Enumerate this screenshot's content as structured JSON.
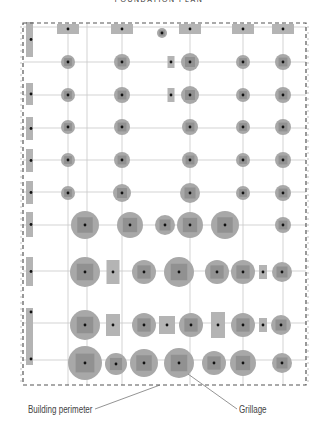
{
  "title": "FOUNDATION PLAN",
  "labels": {
    "perimeter": "Building perimeter",
    "grillage": "Grillage"
  },
  "colors": {
    "grid_line": "#c8c8c8",
    "perimeter": "#555555",
    "footing_fill": "#a8a8a8",
    "footing_core": "#7e7e7e",
    "strip_fill": "#b4b4b4",
    "pile": "#111111",
    "leader": "#666666"
  },
  "grid": {
    "columns_x": [
      31,
      68,
      122,
      180,
      242,
      284
    ],
    "rows_y": [
      27,
      62,
      95,
      128,
      160,
      192,
      225,
      271,
      323,
      360
    ]
  },
  "perimeter_box": {
    "x": 23,
    "y": 23,
    "w": 283,
    "h": 362
  },
  "left_strips": [
    {
      "y": 22,
      "h": 35
    },
    {
      "y": 83,
      "h": 22
    },
    {
      "y": 117,
      "h": 23
    },
    {
      "y": 149,
      "h": 23
    },
    {
      "y": 181,
      "h": 23
    },
    {
      "y": 212,
      "h": 25
    },
    {
      "y": 257,
      "h": 29
    },
    {
      "y": 308,
      "h": 57
    }
  ],
  "footings": [
    {
      "t": "rect",
      "x": 68,
      "y": 29,
      "w": 22,
      "h": 10
    },
    {
      "t": "rect",
      "x": 122,
      "y": 29,
      "w": 22,
      "h": 10
    },
    {
      "t": "circ",
      "x": 162,
      "y": 33,
      "r": 5
    },
    {
      "t": "rect",
      "x": 190,
      "y": 29,
      "w": 22,
      "h": 10
    },
    {
      "t": "rect",
      "x": 243,
      "y": 29,
      "w": 22,
      "h": 10
    },
    {
      "t": "rect",
      "x": 283,
      "y": 29,
      "w": 22,
      "h": 10
    },
    {
      "t": "circ",
      "x": 68,
      "y": 62,
      "r": 7
    },
    {
      "t": "circ",
      "x": 122,
      "y": 62,
      "r": 8
    },
    {
      "t": "rect",
      "x": 171,
      "y": 62,
      "w": 7,
      "h": 12
    },
    {
      "t": "circ",
      "x": 190,
      "y": 62,
      "r": 9
    },
    {
      "t": "circ",
      "x": 243,
      "y": 62,
      "r": 7
    },
    {
      "t": "circ",
      "x": 283,
      "y": 62,
      "r": 8
    },
    {
      "t": "circ",
      "x": 68,
      "y": 95,
      "r": 7
    },
    {
      "t": "circ",
      "x": 122,
      "y": 95,
      "r": 8
    },
    {
      "t": "rect",
      "x": 171,
      "y": 95,
      "w": 7,
      "h": 14
    },
    {
      "t": "circ",
      "x": 190,
      "y": 95,
      "r": 9
    },
    {
      "t": "circ",
      "x": 243,
      "y": 95,
      "r": 7
    },
    {
      "t": "circ",
      "x": 283,
      "y": 95,
      "r": 8
    },
    {
      "t": "circ",
      "x": 68,
      "y": 127,
      "r": 7
    },
    {
      "t": "circ",
      "x": 122,
      "y": 127,
      "r": 8
    },
    {
      "t": "circ",
      "x": 190,
      "y": 127,
      "r": 8
    },
    {
      "t": "circ",
      "x": 243,
      "y": 127,
      "r": 7
    },
    {
      "t": "circ",
      "x": 283,
      "y": 127,
      "r": 8
    },
    {
      "t": "circ",
      "x": 68,
      "y": 160,
      "r": 7
    },
    {
      "t": "circ",
      "x": 122,
      "y": 160,
      "r": 8
    },
    {
      "t": "circ",
      "x": 190,
      "y": 160,
      "r": 8
    },
    {
      "t": "circ",
      "x": 243,
      "y": 160,
      "r": 7
    },
    {
      "t": "circ",
      "x": 283,
      "y": 160,
      "r": 8
    },
    {
      "t": "circ",
      "x": 68,
      "y": 193,
      "r": 7
    },
    {
      "t": "circ",
      "x": 122,
      "y": 193,
      "r": 9
    },
    {
      "t": "circ",
      "x": 190,
      "y": 193,
      "r": 10
    },
    {
      "t": "circ",
      "x": 243,
      "y": 193,
      "r": 7
    },
    {
      "t": "circ",
      "x": 283,
      "y": 193,
      "r": 8
    },
    {
      "t": "circ",
      "x": 85,
      "y": 225,
      "r": 14
    },
    {
      "t": "circ",
      "x": 130,
      "y": 225,
      "r": 13
    },
    {
      "t": "circ",
      "x": 165,
      "y": 225,
      "r": 10
    },
    {
      "t": "circ",
      "x": 190,
      "y": 225,
      "r": 13
    },
    {
      "t": "circ",
      "x": 225,
      "y": 225,
      "r": 14
    },
    {
      "t": "circ",
      "x": 283,
      "y": 225,
      "r": 8
    },
    {
      "t": "circ",
      "x": 85,
      "y": 272,
      "r": 15
    },
    {
      "t": "rect",
      "x": 113,
      "y": 272,
      "w": 13,
      "h": 24
    },
    {
      "t": "circ",
      "x": 144,
      "y": 272,
      "r": 12
    },
    {
      "t": "circ",
      "x": 179,
      "y": 272,
      "r": 15
    },
    {
      "t": "circ",
      "x": 217,
      "y": 272,
      "r": 12
    },
    {
      "t": "circ",
      "x": 243,
      "y": 272,
      "r": 12
    },
    {
      "t": "rect",
      "x": 263,
      "y": 272,
      "w": 8,
      "h": 14
    },
    {
      "t": "circ",
      "x": 282,
      "y": 272,
      "r": 10
    },
    {
      "t": "circ",
      "x": 85,
      "y": 325,
      "r": 15
    },
    {
      "t": "rect",
      "x": 113,
      "y": 325,
      "w": 14,
      "h": 22
    },
    {
      "t": "circ",
      "x": 144,
      "y": 325,
      "r": 12
    },
    {
      "t": "rect",
      "x": 167,
      "y": 325,
      "w": 16,
      "h": 18
    },
    {
      "t": "circ",
      "x": 191,
      "y": 325,
      "r": 12
    },
    {
      "t": "rect",
      "x": 218,
      "y": 325,
      "w": 14,
      "h": 26
    },
    {
      "t": "circ",
      "x": 243,
      "y": 325,
      "r": 12
    },
    {
      "t": "rect",
      "x": 263,
      "y": 325,
      "w": 8,
      "h": 14
    },
    {
      "t": "circ",
      "x": 281,
      "y": 325,
      "r": 10
    },
    {
      "t": "circ",
      "x": 85,
      "y": 363,
      "r": 17
    },
    {
      "t": "circ",
      "x": 116,
      "y": 364,
      "r": 11
    },
    {
      "t": "circ",
      "x": 144,
      "y": 363,
      "r": 14
    },
    {
      "t": "circ",
      "x": 179,
      "y": 363,
      "r": 15
    },
    {
      "t": "circ",
      "x": 214,
      "y": 363,
      "r": 12
    },
    {
      "t": "circ",
      "x": 243,
      "y": 363,
      "r": 13
    },
    {
      "t": "circ",
      "x": 282,
      "y": 363,
      "r": 10
    }
  ],
  "leaders": [
    {
      "name": "perimeter-leader",
      "x1": 95,
      "y1": 409,
      "x2": 160,
      "y2": 385
    },
    {
      "name": "grillage-leader",
      "x1": 237,
      "y1": 409,
      "x2": 188,
      "y2": 374
    }
  ]
}
